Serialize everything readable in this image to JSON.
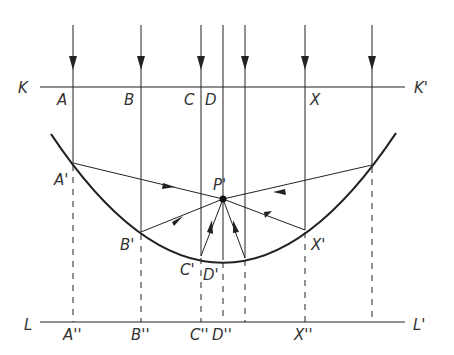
{
  "diagram": {
    "colors": {
      "line": "#222222",
      "label": "#333333",
      "background": "#ffffff"
    },
    "plane_top": {
      "left_label": "K",
      "right_label": "K'"
    },
    "plane_bottom": {
      "left_label": "L",
      "right_label": "L'"
    },
    "focus_label": "P'",
    "rays": [
      {
        "top_label": "A",
        "mirror_label": "A'",
        "bottom_label": "A''"
      },
      {
        "top_label": "B",
        "mirror_label": "B'",
        "bottom_label": "B''"
      },
      {
        "top_label": "C",
        "mirror_label": "C'",
        "bottom_label": "C''"
      },
      {
        "top_label": "D",
        "mirror_label": "D'",
        "bottom_label": "D''"
      },
      {
        "top_label": "",
        "mirror_label": "",
        "bottom_label": ""
      },
      {
        "top_label": "X",
        "mirror_label": "X'",
        "bottom_label": "X''"
      },
      {
        "top_label": "",
        "mirror_label": "",
        "bottom_label": ""
      }
    ]
  }
}
